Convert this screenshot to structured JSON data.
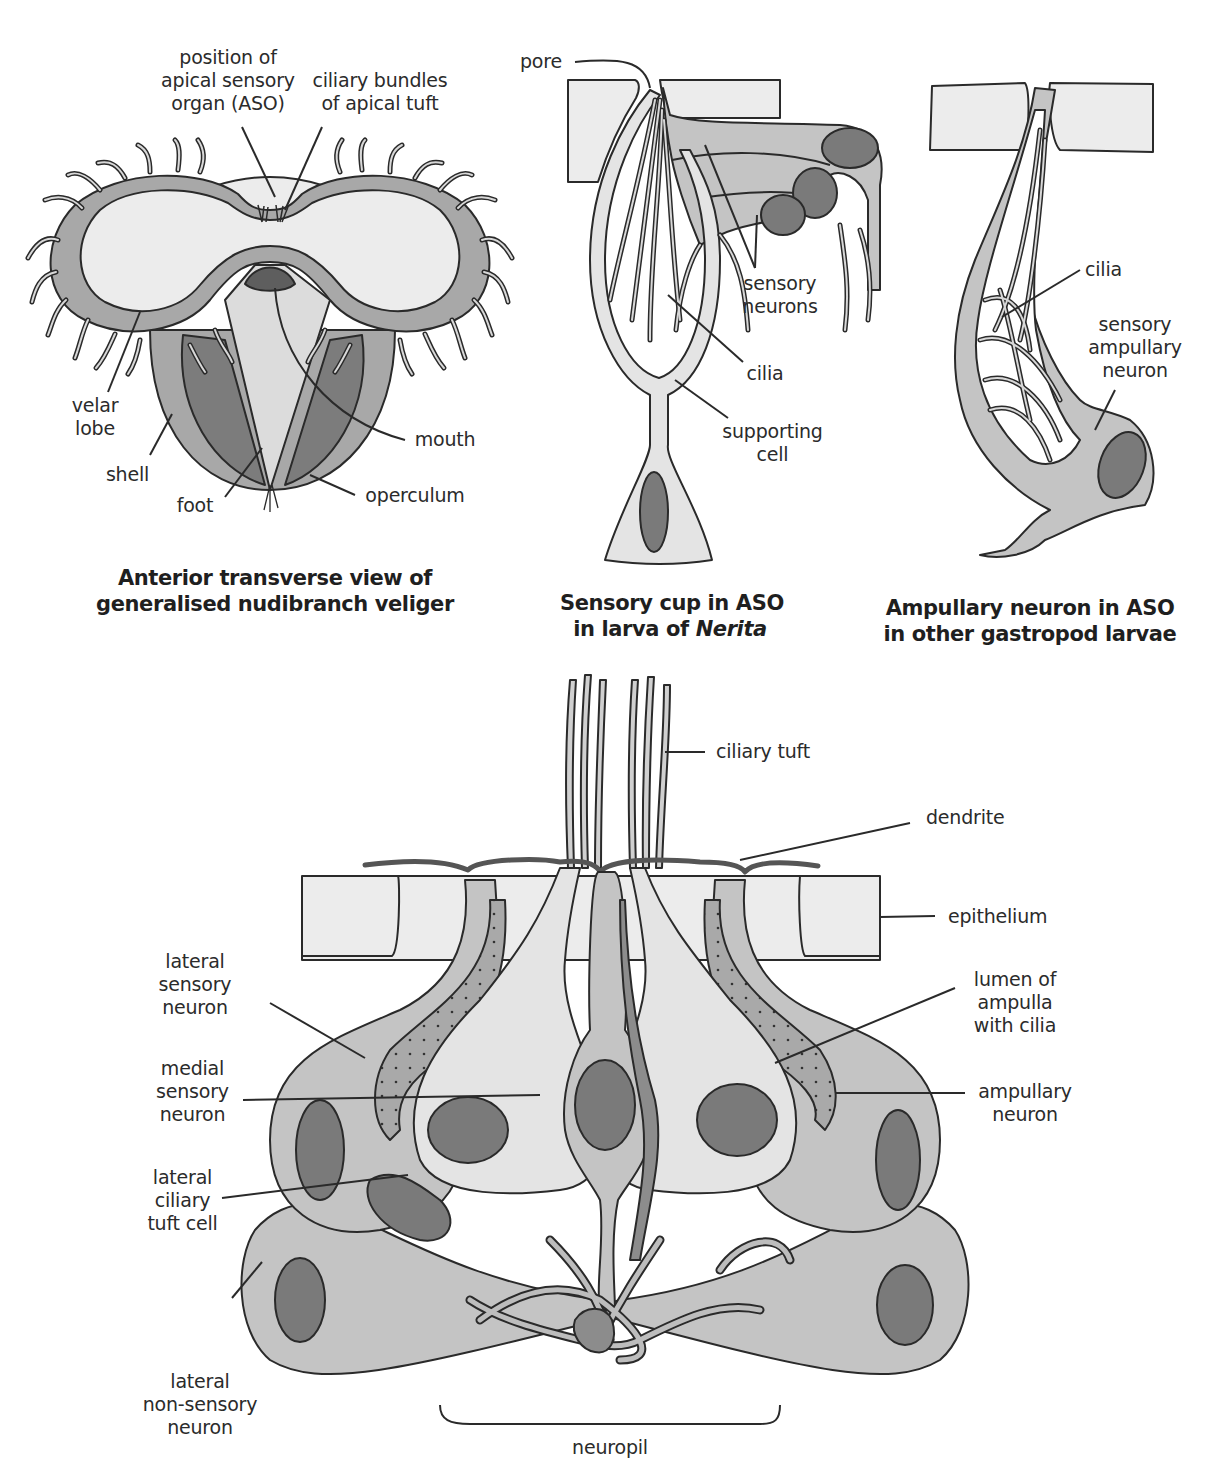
{
  "figure": {
    "panels": [
      {
        "id": "veliger",
        "caption": [
          "Anterior transverse view of",
          "generalised nudibranch veliger"
        ],
        "labels": {
          "aso_position": [
            "position of",
            "apical sensory",
            "organ (ASO)"
          ],
          "ciliary_bundles": [
            "ciliary bundles",
            "of apical tuft"
          ],
          "velar_lobe": [
            "velar",
            "lobe"
          ],
          "shell": "shell",
          "foot": "foot",
          "mouth": "mouth",
          "operculum": "operculum"
        }
      },
      {
        "id": "sensory-cup",
        "caption": [
          "Sensory cup in ASO",
          "in larva of ",
          "Nerita"
        ],
        "labels": {
          "pore": "pore",
          "sensory_neurons": [
            "sensory",
            "neurons"
          ],
          "cilia": "cilia",
          "supporting_cell": [
            "supporting",
            "cell"
          ]
        }
      },
      {
        "id": "ampullary-neuron",
        "caption": [
          "Ampullary neuron in ASO",
          "in other gastropod larvae"
        ],
        "labels": {
          "cilia": "cilia",
          "sensory_ampullary_neuron": [
            "sensory",
            "ampullary",
            "neuron"
          ]
        }
      },
      {
        "id": "aso-section",
        "labels": {
          "ciliary_tuft": "ciliary tuft",
          "dendrite": "dendrite",
          "epithelium": "epithelium",
          "lateral_sensory_neuron": [
            "lateral",
            "sensory",
            "neuron"
          ],
          "medial_sensory_neuron": [
            "medial",
            "sensory",
            "neuron"
          ],
          "lateral_ciliary_tuft_cell": [
            "lateral",
            "ciliary",
            "tuft cell"
          ],
          "lateral_non_sensory_neuron": [
            "lateral",
            "non-sensory",
            "neuron"
          ],
          "lumen_of_ampulla": [
            "lumen of",
            "ampulla",
            "with cilia"
          ],
          "ampullary_neuron": [
            "ampullary",
            "neuron"
          ],
          "neuropil": "neuropil"
        }
      }
    ],
    "colors": {
      "outline": "#2a2a2a",
      "light_fill": "#e6e6e6",
      "mid_fill": "#bdbdbd",
      "dark_fill": "#7a7a7a",
      "very_dark_fill": "#5e5e5e",
      "epithelium_fill": "#ececec"
    }
  }
}
